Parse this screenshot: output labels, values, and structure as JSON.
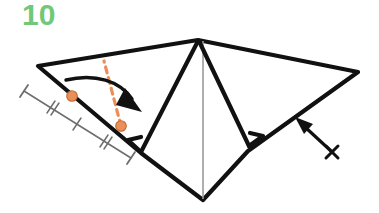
{
  "page": {
    "width": 379,
    "height": 213,
    "background_color": "#ffffff",
    "kind": "origami-instruction-diagram"
  },
  "step": {
    "number_label": "10",
    "number_color": "#70c878"
  },
  "palette": {
    "fold_line": "#111111",
    "crease_line": "#8a8a8a",
    "measure_line": "#6d6d6d",
    "marker_orange": "#e8905a",
    "marker_orange_stroke": "#c46a33",
    "dash_orange": "#ed8f55",
    "paper_fill": "#ffffff"
  },
  "figure": {
    "name": "folded-paper-model",
    "outline_points": "38,66 198,40 358,72 248,151 203,200 141,153",
    "center_crease": {
      "x1": 203,
      "y1": 41,
      "x2": 203,
      "y2": 199
    },
    "left_flap_points": "198,41 141,152 128,140",
    "right_flap_points": "198,41 250,145 263,137"
  },
  "annotations": {
    "dots": [
      {
        "name": "reference-dot-upper",
        "cx": 72,
        "cy": 97,
        "r": 5.2
      },
      {
        "name": "reference-dot-lower",
        "cx": 121,
        "cy": 127,
        "r": 5.2
      }
    ],
    "dashed_fold": {
      "name": "valley-fold-dashed-line",
      "x1": 121,
      "y1": 127,
      "x2": 105,
      "y2": 62,
      "dash": "5 5",
      "width": 3
    },
    "curved_arrow": {
      "name": "fold-direction-curved-arrow",
      "path": "M 66,80 C 96,74 120,82 133,100",
      "head": "128,89 142,110 118,106"
    },
    "straight_arrow": {
      "name": "fold-direction-straight-arrow",
      "shaft": {
        "x1": 332,
        "y1": 152,
        "x2": 302,
        "y2": 124
      },
      "head": "296,118 316,127 306,136",
      "cross": {
        "cx": 332,
        "cy": 152,
        "r": 7
      }
    },
    "measurement": {
      "name": "equal-segments-measure",
      "line": {
        "x1": 24,
        "y1": 91,
        "x2": 130,
        "y2": 157
      },
      "cap_half_length": 7,
      "segments": 4,
      "ticks": [
        {
          "name": "tick-hash-double-1",
          "t": 0.25,
          "style": "double-slash"
        },
        {
          "name": "tick-single-2",
          "t": 0.5,
          "style": "single"
        },
        {
          "name": "tick-hash-double-3",
          "t": 0.75,
          "style": "double-slash"
        }
      ]
    }
  }
}
